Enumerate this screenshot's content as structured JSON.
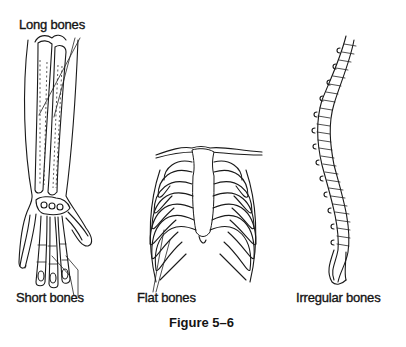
{
  "figure": {
    "caption": "Figure 5–6",
    "labels": {
      "long_bones": "Long bones",
      "short_bones": "Short bones",
      "flat_bones": "Flat bones",
      "irregular_bones": "Irregular bones"
    },
    "illustrations": [
      {
        "name": "forearm-and-hand",
        "depicts": [
          "long bones",
          "short bones"
        ]
      },
      {
        "name": "rib-cage",
        "depicts": [
          "flat bones"
        ]
      },
      {
        "name": "vertebral-column",
        "depicts": [
          "irregular bones"
        ]
      }
    ]
  }
}
